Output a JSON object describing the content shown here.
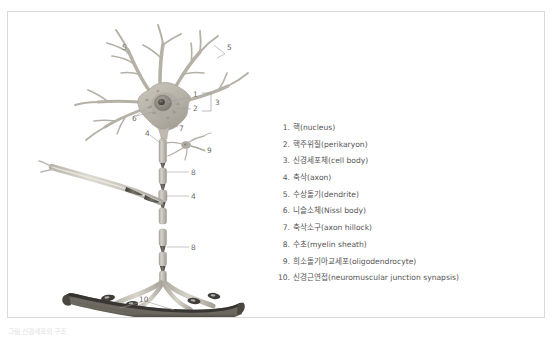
{
  "figure": {
    "caption": "그림  신경세포의 구조",
    "frame_color": "#d9d9d9",
    "background": "#ffffff"
  },
  "legend": {
    "items": [
      {
        "num": "1.",
        "label": "핵(nucleus)"
      },
      {
        "num": "2.",
        "label": "핵주위질(perikaryon)"
      },
      {
        "num": "3.",
        "label": "신경세포체(cell body)"
      },
      {
        "num": "4.",
        "label": "축삭(axon)"
      },
      {
        "num": "5.",
        "label": "수상돌기(dendrite)"
      },
      {
        "num": "6.",
        "label": "니슬소체(Nissl body)"
      },
      {
        "num": "7.",
        "label": "축삭소구(axon hillock)"
      },
      {
        "num": "8.",
        "label": "수초(myelin sheath)"
      },
      {
        "num": "9.",
        "label": "희소돌기아교세포(oligodendrocyte)"
      },
      {
        "num": "10.",
        "label": "신경근연접(neuromuscular junction synapsis)"
      }
    ]
  },
  "diagram": {
    "callouts": [
      {
        "id": "c5a",
        "text": "5",
        "x": 116,
        "y": 36
      },
      {
        "id": "c5b",
        "text": "5",
        "x": 221,
        "y": 36
      },
      {
        "id": "c1",
        "text": "1",
        "x": 186,
        "y": 84
      },
      {
        "id": "c2",
        "text": "2",
        "x": 186,
        "y": 97
      },
      {
        "id": "c3",
        "text": "3",
        "x": 207,
        "y": 90
      },
      {
        "id": "c6",
        "text": "6",
        "x": 126,
        "y": 106
      },
      {
        "id": "c7",
        "text": "7",
        "x": 173,
        "y": 117
      },
      {
        "id": "c4a",
        "text": "4",
        "x": 138,
        "y": 123
      },
      {
        "id": "c9",
        "text": "9",
        "x": 200,
        "y": 139
      },
      {
        "id": "c8a",
        "text": "8",
        "x": 184,
        "y": 160
      },
      {
        "id": "c4b",
        "text": "4",
        "x": 184,
        "y": 184
      },
      {
        "id": "c8b",
        "text": "8",
        "x": 184,
        "y": 235
      },
      {
        "id": "c10",
        "text": "10",
        "x": 134,
        "y": 287
      }
    ],
    "colors": {
      "soma_fill": "#b9b4aa",
      "soma_stroke": "#9d988e",
      "nucleus_fill": "#8e8a82",
      "nucleolus_fill": "#4e4c48",
      "perikaryon_fill": "#a7a299",
      "dendrite_stroke": "#b7b2a8",
      "axon_fill": "#cdc9c0",
      "myelin_fill": "#bdb8ae",
      "node_dark": "#57554f",
      "muscle_fill": "#6e6a63",
      "muscle_dark": "#3c3a36",
      "leader_line": "#9a9a9a",
      "callout_text": "#6b6b6b"
    },
    "parts": [
      {
        "name": "dendrites",
        "ref": "5"
      },
      {
        "name": "cell-body-soma",
        "ref": "3"
      },
      {
        "name": "nucleus",
        "ref": "1"
      },
      {
        "name": "perikaryon",
        "ref": "2"
      },
      {
        "name": "nissl-bodies",
        "ref": "6"
      },
      {
        "name": "axon-hillock",
        "ref": "7"
      },
      {
        "name": "axon",
        "ref": "4"
      },
      {
        "name": "myelin-sheath",
        "ref": "8"
      },
      {
        "name": "oligodendrocyte",
        "ref": "9"
      },
      {
        "name": "neuromuscular-junction",
        "ref": "10"
      }
    ]
  }
}
